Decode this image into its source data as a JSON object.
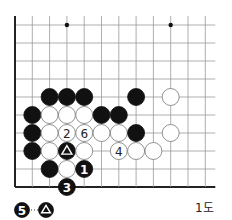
{
  "diagram": {
    "caption": "1도",
    "board": {
      "origin_x": 15,
      "origin_y": 25,
      "col_spacing": 17.3,
      "row_spacing": 18,
      "cols": 12,
      "rows": 10,
      "left_edge": true,
      "bottom_edge": true,
      "star_points": [
        [
          3,
          0
        ],
        [
          9,
          0
        ]
      ],
      "stone_radius": 8.5
    },
    "stones": [
      {
        "col": 2,
        "row": 4,
        "color": "black"
      },
      {
        "col": 3,
        "row": 4,
        "color": "black"
      },
      {
        "col": 4,
        "row": 4,
        "color": "black"
      },
      {
        "col": 7,
        "row": 4,
        "color": "black"
      },
      {
        "col": 9,
        "row": 4,
        "color": "white"
      },
      {
        "col": 1,
        "row": 5,
        "color": "black"
      },
      {
        "col": 2,
        "row": 5,
        "color": "white"
      },
      {
        "col": 3,
        "row": 5,
        "color": "white"
      },
      {
        "col": 4,
        "row": 5,
        "color": "white"
      },
      {
        "col": 5,
        "row": 5,
        "color": "black"
      },
      {
        "col": 6,
        "row": 5,
        "color": "black"
      },
      {
        "col": 1,
        "row": 6,
        "color": "black"
      },
      {
        "col": 2,
        "row": 6,
        "color": "white"
      },
      {
        "col": 3,
        "row": 6,
        "color": "white",
        "label": "2"
      },
      {
        "col": 4,
        "row": 6,
        "color": "white",
        "label": "6"
      },
      {
        "col": 5,
        "row": 6,
        "color": "white"
      },
      {
        "col": 6,
        "row": 6,
        "color": "white"
      },
      {
        "col": 7,
        "row": 6,
        "color": "black"
      },
      {
        "col": 9,
        "row": 6,
        "color": "white"
      },
      {
        "col": 1,
        "row": 7,
        "color": "black"
      },
      {
        "col": 2,
        "row": 7,
        "color": "white"
      },
      {
        "col": 3,
        "row": 7,
        "color": "black",
        "mark": "triangle"
      },
      {
        "col": 4,
        "row": 7,
        "color": "white"
      },
      {
        "col": 6,
        "row": 7,
        "color": "white",
        "label": "4"
      },
      {
        "col": 7,
        "row": 7,
        "color": "white"
      },
      {
        "col": 8,
        "row": 7,
        "color": "white"
      },
      {
        "col": 2,
        "row": 8,
        "color": "black"
      },
      {
        "col": 3,
        "row": 8,
        "color": "white"
      },
      {
        "col": 4,
        "row": 8,
        "color": "black",
        "label": "1"
      },
      {
        "col": 3,
        "row": 9,
        "color": "black",
        "label": "3"
      }
    ],
    "note": {
      "move_label": "5",
      "move_color": "black",
      "connector": "···",
      "target_mark": "triangle",
      "target_color": "black",
      "x": 22,
      "y": 210
    }
  }
}
